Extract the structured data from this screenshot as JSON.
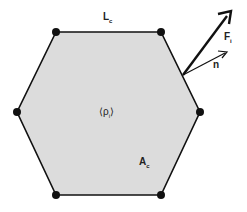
{
  "diagram": {
    "shape": "hexagon",
    "fill_color": "#dcdcdc",
    "edge_color": "#111111",
    "vertices": [
      [
        56,
        32
      ],
      [
        161,
        32
      ],
      [
        200,
        112
      ],
      [
        161,
        195
      ],
      [
        56,
        195
      ],
      [
        17,
        112
      ]
    ],
    "labels": {
      "edge_length": {
        "main": "L",
        "sub": "c"
      },
      "density": {
        "main": "⟨ρ",
        "sub": "i",
        "close": "⟩"
      },
      "area": {
        "main": "A",
        "sub": "c"
      },
      "force": {
        "main": "F",
        "sub": "i"
      },
      "normal": {
        "main": "n"
      }
    },
    "arrows": {
      "origin": [
        183,
        75
      ],
      "force_tip": [
        230,
        12
      ],
      "normal_tip": [
        226,
        52
      ]
    }
  }
}
